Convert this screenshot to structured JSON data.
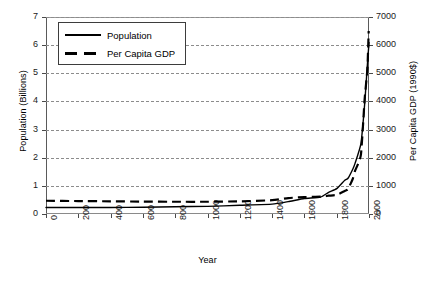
{
  "chart_data": {
    "type": "line",
    "title": "",
    "xlabel": "Year",
    "ylabel": "Population (Billions)",
    "y2label": "Per Capita GDP (1990$)",
    "xlim": [
      0,
      2000
    ],
    "ylim": [
      0,
      7
    ],
    "y2lim": [
      0,
      7000
    ],
    "xticks": [
      0,
      200,
      400,
      600,
      800,
      1000,
      1200,
      1400,
      1600,
      1800,
      2000
    ],
    "xtick_labels": [
      "0",
      "200",
      "400",
      "600",
      "800",
      "1000",
      "1200",
      "1400",
      "1600",
      "1800",
      "2000"
    ],
    "yticks": [
      0,
      1,
      2,
      3,
      4,
      5,
      6,
      7
    ],
    "ytick_labels": [
      "0",
      "1",
      "2",
      "3",
      "4",
      "5",
      "6",
      "7"
    ],
    "y2ticks": [
      0,
      1000,
      2000,
      3000,
      4000,
      5000,
      6000,
      7000
    ],
    "y2tick_labels": [
      "0",
      "1000",
      "2000",
      "3000",
      "4000",
      "5000",
      "6000",
      "7000"
    ],
    "grid": true,
    "grid_axis": "y",
    "grid_style": "dashed",
    "legend_position": "upper-left",
    "series": [
      {
        "name": "Population",
        "axis": "left",
        "units": "Billions",
        "style": "solid",
        "color": "#000000",
        "x": [
          0,
          200,
          400,
          600,
          800,
          1000,
          1200,
          1400,
          1500,
          1600,
          1700,
          1750,
          1800,
          1850,
          1870,
          1900,
          1913,
          1950,
          1973,
          1990,
          2000
        ],
        "values": [
          0.23,
          0.23,
          0.23,
          0.24,
          0.26,
          0.27,
          0.31,
          0.35,
          0.44,
          0.55,
          0.6,
          0.77,
          0.9,
          1.2,
          1.27,
          1.6,
          1.79,
          2.5,
          3.9,
          5.3,
          6.1
        ]
      },
      {
        "name": "Per Capita GDP",
        "axis": "right",
        "units": "1990$",
        "style": "dashed",
        "color": "#000000",
        "x": [
          0,
          200,
          400,
          600,
          800,
          1000,
          1200,
          1400,
          1500,
          1600,
          1700,
          1750,
          1800,
          1850,
          1870,
          1900,
          1913,
          1950,
          1973,
          1990,
          1998
        ],
        "values": [
          470,
          460,
          450,
          440,
          435,
          435,
          450,
          490,
          565,
          600,
          615,
          650,
          680,
          820,
          880,
          1260,
          1525,
          2110,
          4080,
          5150,
          6500
        ]
      }
    ]
  },
  "legend": {
    "items": [
      {
        "label": "Population",
        "style": "solid"
      },
      {
        "label": "Per Capita GDP",
        "style": "dashed"
      }
    ]
  },
  "caption": {
    "text": ""
  }
}
